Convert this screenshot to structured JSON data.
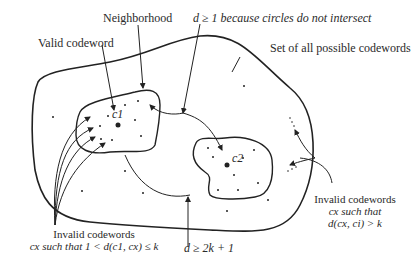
{
  "labels": {
    "neighborhood": "Neighborhood",
    "valid_codeword": "Valid codeword",
    "distance_note": "d ≥ 1 because circles do not intersect",
    "set_all": "Set of all possible codewords",
    "c1": "c1",
    "c2": "c2",
    "invalid_left_line1": "Invalid codewords",
    "invalid_left_line2": "cx such that 1 < d(c1, cx) ≤ k",
    "min_distance": "d ≥ 2k + 1",
    "invalid_right_line1": "Invalid codewords",
    "invalid_right_line2": "cx such that",
    "invalid_right_line3": "d(cx, ci) > k"
  }
}
